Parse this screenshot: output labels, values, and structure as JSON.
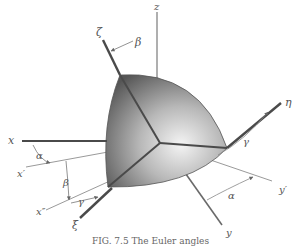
{
  "figure": {
    "caption": "FIG. 7.5 The Euler angles",
    "colors": {
      "axis_thick": "#4a4a4a",
      "axis_thin": "#9a9a9a",
      "shape_dark": "#5a5a5a",
      "shape_light": "#e8e8e8",
      "label": "#555555"
    },
    "axes": {
      "fixed": [
        {
          "name": "x",
          "label": "x"
        },
        {
          "name": "y",
          "label": "y"
        },
        {
          "name": "z",
          "label": "z"
        }
      ],
      "intermediate": [
        {
          "name": "x-prime",
          "label": "x′"
        },
        {
          "name": "x-double-prime",
          "label": "x″"
        },
        {
          "name": "y-prime",
          "label": "y′"
        }
      ],
      "body": [
        {
          "name": "xi",
          "label": "ξ"
        },
        {
          "name": "eta",
          "label": "η"
        },
        {
          "name": "zeta",
          "label": "ζ"
        }
      ]
    },
    "angles": {
      "alpha_xy": "α",
      "alpha_y": "α",
      "beta_x": "β",
      "beta_z": "β",
      "gamma_xi": "γ",
      "gamma_eta": "γ"
    }
  }
}
